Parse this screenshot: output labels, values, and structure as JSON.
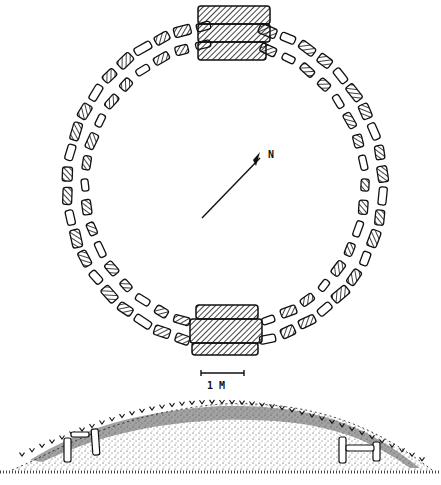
{
  "figure": {
    "plan": {
      "north_label": "N",
      "scale_label": "1 M",
      "ring_stone_count_outer": 46,
      "ring_stone_count_inner": 40,
      "entrance_blocks_top": 3,
      "entrance_blocks_bottom": 3
    },
    "section": {
      "orthostat_groups": 2
    },
    "colors": {
      "ink": "#111111",
      "paper": "#ffffff"
    }
  }
}
